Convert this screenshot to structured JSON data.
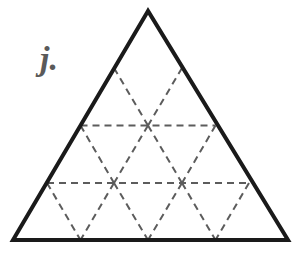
{
  "figure": {
    "label": "j.",
    "label_color": "#5a5a5a",
    "background_color": "#ffffff",
    "outline_color": "#1a1a1a",
    "outline_width_px": 4,
    "dash_color": "#5c5c5c",
    "dash_width_px": 2,
    "dash_pattern": "7,5",
    "shape": "equilateral-triangle",
    "subdivision_rows": 3,
    "small_triangle_count": 9,
    "vertices": {
      "apex": [
        148,
        11
      ],
      "bottom_left": [
        13,
        240
      ],
      "bottom_right": [
        288,
        240
      ]
    },
    "dashed_segments": [
      {
        "name": "horizontal-upper-midline",
        "from": [
          80.5,
          125.5
        ],
        "to": [
          215.5,
          125.5
        ]
      },
      {
        "name": "horizontal-lower-midline",
        "from": [
          47,
          183
        ],
        "to": [
          249,
          183
        ]
      },
      {
        "name": "left-lean-row1",
        "from": [
          114,
          68
        ],
        "to": [
          148,
          125.5
        ]
      },
      {
        "name": "right-lean-row1",
        "from": [
          182,
          68
        ],
        "to": [
          148,
          125.5
        ]
      },
      {
        "name": "left-lean-row2-a",
        "from": [
          80.5,
          125.5
        ],
        "to": [
          114,
          183
        ]
      },
      {
        "name": "right-lean-row2-a",
        "from": [
          148,
          125.5
        ],
        "to": [
          114,
          183
        ]
      },
      {
        "name": "left-lean-row2-b",
        "from": [
          148,
          125.5
        ],
        "to": [
          182,
          183
        ]
      },
      {
        "name": "right-lean-row2-b",
        "from": [
          215.5,
          125.5
        ],
        "to": [
          182,
          183
        ]
      },
      {
        "name": "left-lean-row3-a",
        "from": [
          47,
          183
        ],
        "to": [
          80.5,
          240
        ]
      },
      {
        "name": "right-lean-row3-a",
        "from": [
          114,
          183
        ],
        "to": [
          80.5,
          240
        ]
      },
      {
        "name": "left-lean-row3-b",
        "from": [
          114,
          183
        ],
        "to": [
          148,
          240
        ]
      },
      {
        "name": "right-lean-row3-b",
        "from": [
          182,
          183
        ],
        "to": [
          148,
          240
        ]
      },
      {
        "name": "left-lean-row3-c",
        "from": [
          182,
          183
        ],
        "to": [
          215.5,
          240
        ]
      },
      {
        "name": "right-lean-row3-c",
        "from": [
          249,
          183
        ],
        "to": [
          215.5,
          240
        ]
      }
    ]
  }
}
